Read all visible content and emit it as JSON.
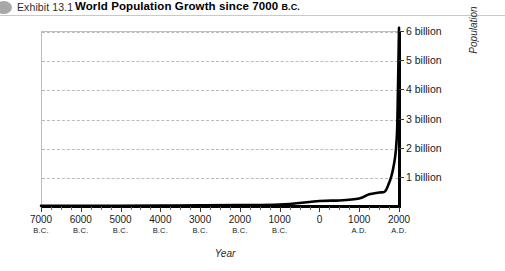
{
  "header": {
    "bullet_icon": "circle-bullet-icon",
    "exhibit_label": "Exhibit 13.1",
    "title_main": "World Population Growth since 7000 ",
    "title_era": "B.C."
  },
  "chart_data": {
    "type": "line",
    "title": "World Population Growth since 7000 B.C.",
    "xlabel": "Year",
    "ylabel": "Population",
    "grid": true,
    "legend": "none",
    "xlim": [
      -7000,
      2000
    ],
    "ylim": [
      0,
      6
    ],
    "y_unit": "billion",
    "x_tick_values": [
      -7000,
      -6000,
      -5000,
      -4000,
      -3000,
      -2000,
      -1000,
      0,
      1000,
      2000
    ],
    "x_tick_labels": [
      {
        "value": "7000",
        "era": "B.C."
      },
      {
        "value": "6000",
        "era": "B.C."
      },
      {
        "value": "5000",
        "era": "B.C."
      },
      {
        "value": "4000",
        "era": "B.C."
      },
      {
        "value": "3000",
        "era": "B.C."
      },
      {
        "value": "2000",
        "era": "B.C."
      },
      {
        "value": "1000",
        "era": "B.C."
      },
      {
        "value": "0",
        "era": ""
      },
      {
        "value": "1000",
        "era": "A.D."
      },
      {
        "value": "2000",
        "era": "A.D."
      }
    ],
    "y_tick_values": [
      1,
      2,
      3,
      4,
      5,
      6
    ],
    "y_tick_labels": [
      "1 billion",
      "2 billion",
      "3 billion",
      "4 billion",
      "5 billion",
      "6 billion"
    ],
    "series": [
      {
        "name": "World population",
        "color": "#000000",
        "x": [
          -7000,
          -6000,
          -5000,
          -4000,
          -3000,
          -2000,
          -1000,
          0,
          500,
          1000,
          1250,
          1500,
          1650,
          1750,
          1800,
          1850,
          1900,
          1927,
          1950,
          1960,
          1974,
          1987,
          1999,
          2000
        ],
        "y": [
          0.005,
          0.007,
          0.01,
          0.015,
          0.02,
          0.03,
          0.05,
          0.17,
          0.19,
          0.26,
          0.4,
          0.46,
          0.5,
          0.79,
          0.98,
          1.26,
          1.65,
          2.0,
          2.5,
          3.0,
          4.0,
          5.0,
          6.0,
          6.1
        ]
      }
    ]
  }
}
